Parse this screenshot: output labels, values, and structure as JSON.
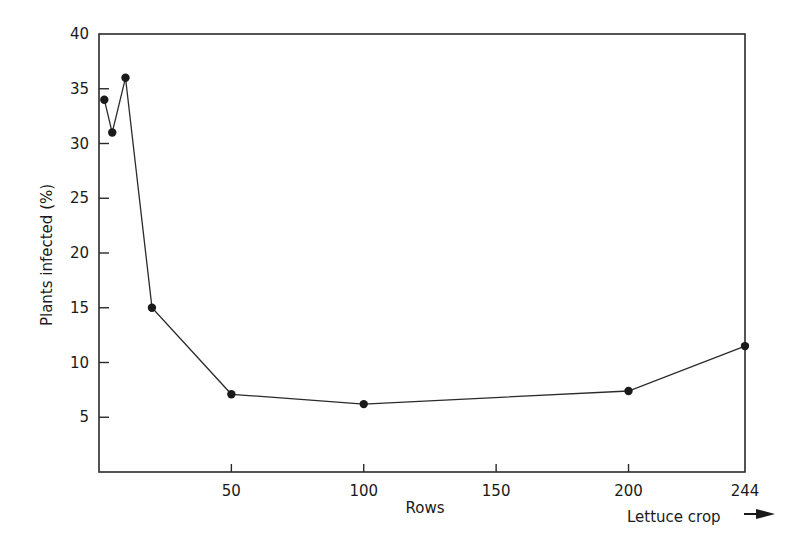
{
  "chart_data": {
    "type": "line",
    "title": "",
    "xlabel": "Rows",
    "ylabel": "Plants infected (%)",
    "x_annotation": "Lettuce crop →",
    "xlim": [
      0,
      244
    ],
    "ylim": [
      0,
      40
    ],
    "x_ticks": [
      50,
      100,
      150,
      200,
      244
    ],
    "y_ticks": [
      5,
      10,
      15,
      20,
      25,
      30,
      35,
      40
    ],
    "grid": false,
    "legend": null,
    "series": [
      {
        "name": "Plants infected",
        "x": [
          2,
          5,
          10,
          20,
          50,
          100,
          200,
          244
        ],
        "y": [
          34,
          31,
          36,
          15,
          7.1,
          6.2,
          7.4,
          11.5
        ]
      }
    ]
  },
  "labels": {
    "xlabel": "Rows",
    "ylabel": "Plants infected (%)",
    "x_annotation": "Lettuce crop"
  },
  "colors": {
    "line": "#2a2a2a",
    "marker": "#1a1a1a",
    "axis": "#2a2a2a"
  }
}
